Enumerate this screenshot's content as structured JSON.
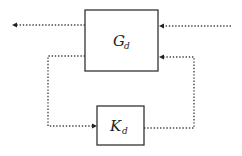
{
  "diagram": {
    "type": "block-diagram",
    "blocks": [
      {
        "id": "plant",
        "symbol": "G",
        "subscript": "d"
      },
      {
        "id": "controller",
        "symbol": "K",
        "subscript": "d"
      }
    ],
    "signals": [
      {
        "from": "plant",
        "to": "output-left",
        "style": "dotted"
      },
      {
        "from": "input-right",
        "to": "plant",
        "style": "dotted"
      },
      {
        "from": "plant",
        "to": "controller",
        "style": "dotted"
      },
      {
        "from": "controller",
        "to": "plant",
        "style": "dotted"
      }
    ],
    "colors": {
      "stroke": "#333333",
      "background": "#ffffff"
    }
  }
}
